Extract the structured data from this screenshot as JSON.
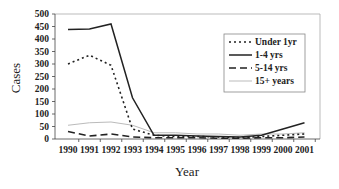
{
  "chart_data": {
    "type": "line",
    "title": "",
    "xlabel": "Year",
    "ylabel": "Cases",
    "ylim": [
      0,
      500
    ],
    "yticks": [
      0,
      50,
      100,
      150,
      200,
      250,
      300,
      350,
      400,
      450,
      500
    ],
    "grid": false,
    "legend_position": "upper right (inside)",
    "categories": [
      "1990",
      "1991",
      "1992",
      "1993",
      "1994",
      "1995",
      "1996",
      "1997",
      "1998",
      "1999",
      "2000",
      "2001"
    ],
    "series": [
      {
        "name": "Under 1yr",
        "style": "dotted",
        "color": "#222222",
        "width": 1.6,
        "values": [
          300,
          335,
          295,
          40,
          15,
          10,
          10,
          8,
          5,
          10,
          15,
          20
        ]
      },
      {
        "name": "1-4 yrs",
        "style": "solid",
        "color": "#222222",
        "width": 1.5,
        "values": [
          438,
          440,
          460,
          165,
          15,
          15,
          12,
          10,
          8,
          15,
          40,
          65
        ]
      },
      {
        "name": "5-14 yrs",
        "style": "dashed",
        "color": "#222222",
        "width": 1.6,
        "values": [
          30,
          12,
          20,
          8,
          5,
          5,
          5,
          3,
          3,
          5,
          5,
          8
        ]
      },
      {
        "name": "15+ years",
        "style": "solid",
        "color": "#bbbbbb",
        "width": 1,
        "values": [
          55,
          65,
          68,
          55,
          25,
          25,
          20,
          20,
          15,
          20,
          20,
          25
        ]
      }
    ]
  }
}
